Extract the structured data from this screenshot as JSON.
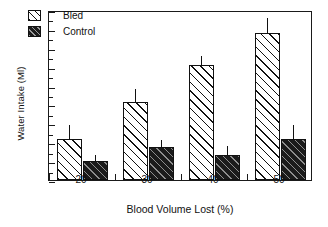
{
  "chart_data": {
    "type": "bar",
    "title": "",
    "xlabel": "Blood Volume Lost (%)",
    "ylabel": "Water Intake (Ml)",
    "categories": [
      "20",
      "30",
      "40",
      "50"
    ],
    "series": [
      {
        "name": "Bled",
        "values": [
          2.15,
          4.15,
          6.1,
          7.8
        ],
        "errors_upper": [
          2.9,
          4.8,
          6.55,
          8.6
        ],
        "fill": "#ffffff",
        "hatch": "diagonal-45"
      },
      {
        "name": "Control",
        "values": [
          1.0,
          1.75,
          1.35,
          2.15
        ],
        "errors_upper": [
          1.35,
          2.1,
          1.8,
          2.9
        ],
        "fill": "#1b1b1b",
        "hatch": "diagonal-45"
      }
    ],
    "ylim": [
      0,
      9
    ],
    "yticks": [
      0,
      1,
      2,
      3,
      4,
      5,
      6,
      7,
      8,
      9
    ],
    "ytick_labels": [
      "0",
      "1",
      "2",
      "3",
      "4",
      "5",
      "6",
      "7",
      "8",
      "9"
    ],
    "minor_yticks": [
      0.5,
      1.5,
      2.5,
      3.5,
      4.5,
      5.5,
      6.5,
      7.5,
      8.5
    ],
    "grid": false,
    "legend_position": "upper-left",
    "frame": "full-box",
    "tick_direction": "in",
    "error_bar_style": "upper-only-no-caps"
  },
  "legend": {
    "items": [
      {
        "label": "Bled"
      },
      {
        "label": "Control"
      }
    ]
  },
  "axes": {
    "y_title": "Water Intake (Ml)",
    "x_title": "Blood Volume Lost (%)"
  }
}
